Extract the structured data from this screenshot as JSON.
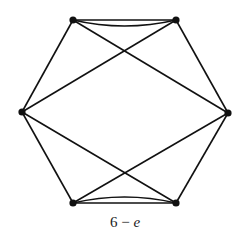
{
  "diagram": {
    "caption_number": "6",
    "caption_operator": "−",
    "caption_variable": "e",
    "colors": {
      "stroke": "#111111",
      "background": "#ffffff"
    },
    "nodes": [
      {
        "id": "top-left",
        "x": 73,
        "y": 20
      },
      {
        "id": "top-right",
        "x": 176,
        "y": 20
      },
      {
        "id": "left",
        "x": 22,
        "y": 112
      },
      {
        "id": "right",
        "x": 228,
        "y": 113
      },
      {
        "id": "bottom-left",
        "x": 73,
        "y": 203
      },
      {
        "id": "bottom-right",
        "x": 176,
        "y": 203
      }
    ],
    "edges": [
      {
        "from": "top-left",
        "to": "top-right",
        "type": "straight"
      },
      {
        "from": "top-left",
        "to": "top-right",
        "type": "curved"
      },
      {
        "from": "bottom-left",
        "to": "bottom-right",
        "type": "straight"
      },
      {
        "from": "bottom-left",
        "to": "bottom-right",
        "type": "curved"
      },
      {
        "from": "top-left",
        "to": "left",
        "type": "straight"
      },
      {
        "from": "top-right",
        "to": "right",
        "type": "straight"
      },
      {
        "from": "left",
        "to": "bottom-left",
        "type": "straight"
      },
      {
        "from": "right",
        "to": "bottom-right",
        "type": "straight"
      },
      {
        "from": "top-left",
        "to": "right",
        "type": "straight"
      },
      {
        "from": "top-right",
        "to": "left",
        "type": "straight"
      },
      {
        "from": "left",
        "to": "bottom-right",
        "type": "straight"
      },
      {
        "from": "right",
        "to": "bottom-left",
        "type": "straight"
      }
    ]
  }
}
